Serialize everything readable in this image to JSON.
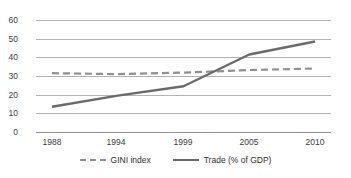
{
  "chart_data": {
    "type": "line",
    "title": "",
    "subtitle": "",
    "xlabel": "",
    "ylabel": "",
    "categories": [
      "1988",
      "1994",
      "1999",
      "2005",
      "2010"
    ],
    "x_positions": [
      0.0,
      0.25,
      0.5,
      0.75,
      1.0
    ],
    "ylim": [
      0,
      60
    ],
    "yticks": [
      0,
      10,
      20,
      30,
      40,
      50,
      60
    ],
    "ytick_labels": [
      "0",
      "10",
      "20",
      "30",
      "40",
      "50",
      "60"
    ],
    "grid": true,
    "grid_axis": "y",
    "legend_position": "bottom",
    "series": [
      {
        "name": "GINI index",
        "style": "dashed",
        "color": "#909090",
        "x": [
          "1988",
          "1994",
          "1999",
          "2005",
          "2010"
        ],
        "values": [
          31.5,
          31.0,
          31.8,
          33.2,
          34.0
        ]
      },
      {
        "name": "Trade (% of GDP)",
        "style": "solid",
        "color": "#6b6b6b",
        "x": [
          "1988",
          "1994",
          "1999",
          "2005",
          "2010"
        ],
        "values": [
          13.5,
          19.5,
          24.5,
          41.5,
          48.5
        ]
      }
    ]
  },
  "axes": {
    "y_tick_labels": [
      "60",
      "50",
      "40",
      "30",
      "20",
      "10",
      "0"
    ],
    "x_tick_labels": [
      "1988",
      "1994",
      "1999",
      "2005",
      "2010"
    ]
  },
  "legend": {
    "entries": [
      {
        "label": "GINI index",
        "color": "#909090",
        "style": "dashed"
      },
      {
        "label": "Trade (% of GDP)",
        "color": "#6b6b6b",
        "style": "solid"
      }
    ]
  },
  "colors": {
    "gridline": "#b3b3b3",
    "axis": "#8f8f8f",
    "gini_series": "#909090",
    "trade_series": "#6b6b6b",
    "text": "#3b3b3b",
    "background": "#ffffff"
  }
}
